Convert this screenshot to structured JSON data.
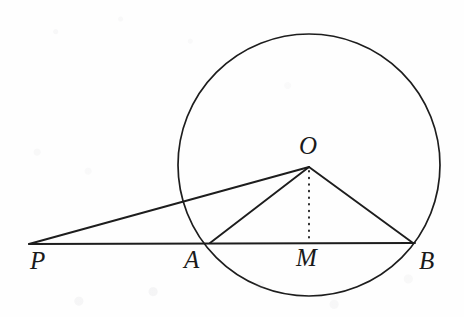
{
  "figure": {
    "ink_color": "#1d1d1d",
    "paper_color": "#fefefe",
    "width": 464,
    "height": 317
  },
  "chart_data": {
    "type": "diagram",
    "subtype": "euclidean-geometry",
    "canvas": {
      "width": 464,
      "height": 317
    },
    "circle": {
      "name": "circle-O",
      "center": {
        "x": 309,
        "y": 165
      },
      "radius": 131,
      "stroke": "#1d1d1d",
      "stroke_width": 1.7,
      "fill": "none"
    },
    "points": [
      {
        "label": "P",
        "x": 29,
        "y": 244,
        "label_x": 38,
        "label_y": 262,
        "on_circle": false,
        "note": "external point"
      },
      {
        "label": "A",
        "x": 210,
        "y": 243,
        "label_x": 194,
        "label_y": 261,
        "on_circle": true,
        "note": "near intersection of secant with circle"
      },
      {
        "label": "M",
        "x": 309,
        "y": 243,
        "label_x": 310,
        "label_y": 259,
        "on_circle": false,
        "note": "foot of perpendicular from O to AB; midpoint of chord"
      },
      {
        "label": "B",
        "x": 413,
        "y": 243,
        "label_x": 428,
        "label_y": 262,
        "on_circle": true,
        "note": "far intersection of secant with circle"
      },
      {
        "label": "O",
        "x": 309,
        "y": 167,
        "label_x": 308,
        "label_y": 148,
        "on_circle": false,
        "note": "center of circle"
      }
    ],
    "segments": [
      {
        "name": "PB",
        "from": "P",
        "to": "B",
        "style": "solid",
        "x1": 29,
        "y1": 244,
        "x2": 415,
        "y2": 243
      },
      {
        "name": "PO",
        "from": "P",
        "to": "O",
        "style": "solid",
        "x1": 29,
        "y1": 244,
        "x2": 309,
        "y2": 167
      },
      {
        "name": "AO",
        "from": "A",
        "to": "O",
        "style": "solid",
        "x1": 210,
        "y1": 243,
        "x2": 309,
        "y2": 167
      },
      {
        "name": "OB",
        "from": "O",
        "to": "B",
        "style": "solid",
        "x1": 309,
        "y1": 167,
        "x2": 413,
        "y2": 243
      },
      {
        "name": "OM",
        "from": "O",
        "to": "M",
        "style": "dotted",
        "x1": 309,
        "y1": 171,
        "x2": 309,
        "y2": 242
      }
    ],
    "labels": [
      "P",
      "A",
      "M",
      "B",
      "O"
    ],
    "grid": false,
    "legend": null,
    "axes": null
  },
  "labels": {
    "P": "P",
    "A": "A",
    "M": "M",
    "B": "B",
    "O": "O"
  },
  "label_sizes": {
    "P": "25px",
    "A": "25px",
    "M": "25px",
    "B": "25px",
    "O": "25px"
  }
}
